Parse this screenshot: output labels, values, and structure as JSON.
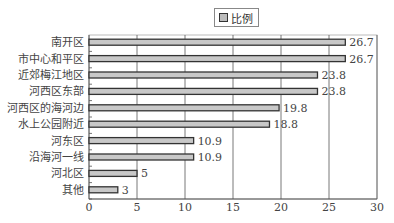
{
  "chart_data": {
    "type": "bar",
    "orientation": "horizontal",
    "title": "",
    "xlabel": "",
    "ylabel": "",
    "categories": [
      "南开区",
      "市中心和平区",
      "近郊梅江地区",
      "河西区东部",
      "河西区的海河边",
      "水上公园附近",
      "河东区",
      "沿海河一线",
      "河北区",
      "其他"
    ],
    "series": [
      {
        "name": "比例",
        "values": [
          26.7,
          26.7,
          23.8,
          23.8,
          19.8,
          18.8,
          10.9,
          10.9,
          5,
          3
        ]
      }
    ],
    "data_labels": [
      "26.7",
      "26.7",
      "23.8",
      "23.8",
      "19.8",
      "18.8",
      "10.9",
      "10.9",
      "5",
      "3"
    ],
    "xlim": [
      0,
      30
    ],
    "x_ticks": [
      0,
      5,
      10,
      15,
      20,
      25,
      30
    ],
    "grid": "vertical",
    "legend_position": "top",
    "colors": {
      "bar_fill": "#c8c8c8",
      "bar_border": "#333333",
      "grid": "#555555",
      "axis": "#555555"
    }
  },
  "legend": {
    "label": "比例"
  }
}
